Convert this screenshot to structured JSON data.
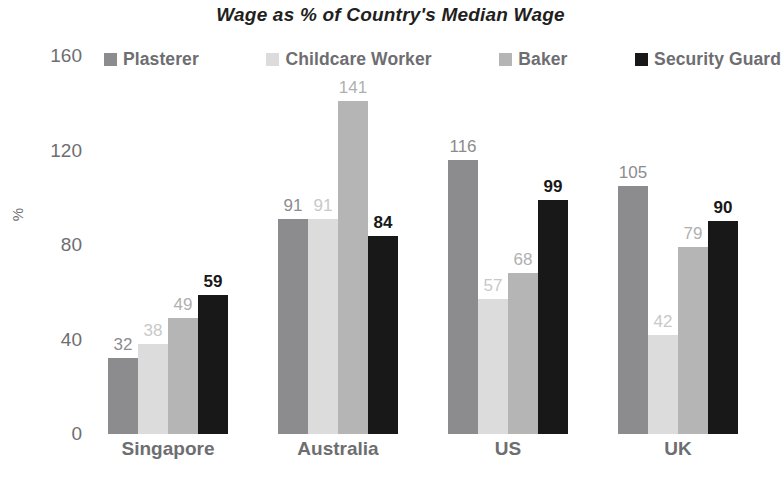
{
  "chart_data": {
    "type": "bar",
    "title": "Wage as % of Country's Median Wage",
    "xlabel": "",
    "ylabel": "%",
    "ylim": [
      0,
      160
    ],
    "yticks": [
      0,
      40,
      80,
      120,
      160
    ],
    "ytick_labels": [
      "0",
      "40",
      "80",
      "120",
      "160"
    ],
    "grid": false,
    "legend_position": "top",
    "categories": [
      "Singapore",
      "Australia",
      "US",
      "UK"
    ],
    "series": [
      {
        "name": "Plasterer",
        "color": "#8c8c8e",
        "label_color": "#8c8c8e",
        "bold_labels": false,
        "values": [
          32,
          91,
          116,
          105
        ]
      },
      {
        "name": "Childcare Worker",
        "color": "#dcdcdc",
        "label_color": "#c8c8c8",
        "bold_labels": false,
        "values": [
          38,
          91,
          57,
          42
        ]
      },
      {
        "name": "Baker",
        "color": "#b5b5b5",
        "label_color": "#b0b0b0",
        "bold_labels": false,
        "values": [
          49,
          141,
          68,
          79
        ]
      },
      {
        "name": "Security Guard",
        "color": "#181818",
        "label_color": "#181818",
        "bold_labels": true,
        "values": [
          59,
          84,
          99,
          90
        ]
      }
    ]
  }
}
